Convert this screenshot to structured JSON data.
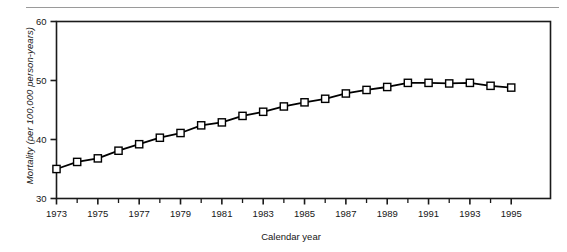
{
  "figure": {
    "has_top_rule": true,
    "background_color": "#ffffff",
    "line_color": "#000000",
    "marker_fill_color": "#ffffff",
    "marker_edge_color": "#000000",
    "axis_color": "#1a1a1a"
  },
  "chart_data": {
    "type": "line",
    "title": "",
    "xlabel": "Calendar year",
    "ylabel": "Mortality (per 100,000 person-years)",
    "xlim": [
      1973,
      1996.9
    ],
    "ylim": [
      30,
      60
    ],
    "grid": false,
    "legend": null,
    "marker": "square",
    "x_tick_labels": [
      "1973",
      "1975",
      "1977",
      "1979",
      "1981",
      "1983",
      "1985",
      "1987",
      "1989",
      "1991",
      "1993",
      "1995"
    ],
    "x_tick_values": [
      1973,
      1975,
      1977,
      1979,
      1981,
      1983,
      1985,
      1987,
      1989,
      1991,
      1993,
      1995
    ],
    "x_minor_tick_values": [
      1974,
      1976,
      1978,
      1980,
      1982,
      1984,
      1986,
      1988,
      1990,
      1992,
      1994
    ],
    "y_tick_labels": [
      "30",
      "40",
      "50",
      "60"
    ],
    "y_tick_values": [
      30,
      40,
      50,
      60
    ],
    "x": [
      1973,
      1974,
      1975,
      1976,
      1977,
      1978,
      1979,
      1980,
      1981,
      1982,
      1983,
      1984,
      1985,
      1986,
      1987,
      1988,
      1989,
      1990,
      1991,
      1992,
      1993,
      1994,
      1995
    ],
    "values": [
      35.0,
      36.2,
      36.8,
      38.1,
      39.2,
      40.3,
      41.1,
      42.4,
      42.9,
      44.0,
      44.7,
      45.6,
      46.3,
      46.9,
      47.8,
      48.4,
      48.9,
      49.6,
      49.6,
      49.5,
      49.6,
      49.1,
      48.8
    ],
    "series": [
      {
        "name": "Mortality",
        "values": [
          35.0,
          36.2,
          36.8,
          38.1,
          39.2,
          40.3,
          41.1,
          42.4,
          42.9,
          44.0,
          44.7,
          45.6,
          46.3,
          46.9,
          47.8,
          48.4,
          48.9,
          49.6,
          49.6,
          49.5,
          49.6,
          49.1,
          48.8
        ]
      }
    ]
  }
}
